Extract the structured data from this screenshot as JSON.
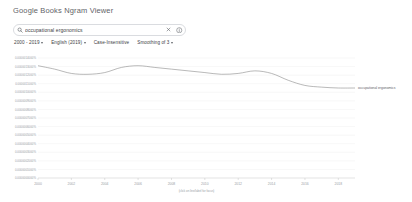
{
  "header": {
    "title": "Google Books Ngram Viewer"
  },
  "search": {
    "value": "occupational ergonomics",
    "placeholder": "Search in Google Books Ngram Viewer",
    "search_icon": "search-icon",
    "clear_icon": "close-icon",
    "info_icon": "info-icon"
  },
  "filters": [
    {
      "label": "2000 - 2019"
    },
    {
      "label": "English (2019)"
    },
    {
      "label": "Case-Insensitive"
    },
    {
      "label": "Smoothing of 3"
    }
  ],
  "chart_data": {
    "type": "line",
    "title": "",
    "xlabel": "(click on line/label for focus)",
    "ylabel": "",
    "grid": true,
    "legend_position": "right",
    "xlim": [
      2000,
      2019
    ],
    "ylim": [
      0.0,
      1.4e-06
    ],
    "xticks": [
      2000,
      2002,
      2004,
      2006,
      2008,
      2010,
      2012,
      2014,
      2016,
      2018
    ],
    "ytick_labels": [
      "0.0000014000%",
      "0.0000013000%",
      "0.0000012000%",
      "0.0000011000%",
      "0.0000010000%",
      "0.0000009000%",
      "0.0000008000%",
      "0.0000007000%",
      "0.0000006000%",
      "0.0000005000%",
      "0.0000004000%",
      "0.0000003000%",
      "0.0000002000%",
      "0.0000001000%",
      "0.0000000000%"
    ],
    "ytick_values": [
      1.4e-06,
      1.3e-06,
      1.2e-06,
      1.1e-06,
      1e-06,
      9e-07,
      8e-07,
      7e-07,
      6e-07,
      5e-07,
      4e-07,
      3e-07,
      2e-07,
      1e-07,
      0.0
    ],
    "series": [
      {
        "name": "occupational ergonomics",
        "color": "#7f7f7f",
        "x": [
          2000,
          2001,
          2002,
          2003,
          2004,
          2005,
          2006,
          2007,
          2008,
          2009,
          2010,
          2011,
          2012,
          2013,
          2014,
          2015,
          2016,
          2017,
          2018,
          2019
        ],
        "values": [
          1.31e-06,
          1.27e-06,
          1.22e-06,
          1.21e-06,
          1.23e-06,
          1.29e-06,
          1.31e-06,
          1.29e-06,
          1.27e-06,
          1.25e-06,
          1.23e-06,
          1.21e-06,
          1.22e-06,
          1.25e-06,
          1.22e-06,
          1.14e-06,
          1.08e-06,
          1.06e-06,
          1.05e-06,
          1.05e-06
        ]
      }
    ]
  }
}
